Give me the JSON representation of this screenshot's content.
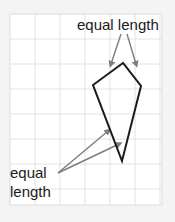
{
  "figure": {
    "type": "geometry-diagram",
    "shape_name": "kite",
    "background_color": "#f4f4f4",
    "canvas_color": "#ffffff",
    "grid": {
      "color": "#e2e2e4",
      "x": 10,
      "y": 14,
      "width": 152,
      "height": 191,
      "cell_size": 25,
      "columns": 6,
      "rows": 7,
      "visible": true
    },
    "shape": {
      "stroke_color": "#1a1a1a",
      "stroke_width": 2,
      "fill": "none",
      "vertices": [
        {
          "name": "apex-top",
          "x": 123,
          "y": 63
        },
        {
          "name": "left",
          "x": 93,
          "y": 85
        },
        {
          "name": "bottom",
          "x": 122,
          "y": 161
        },
        {
          "name": "right",
          "x": 141,
          "y": 86
        }
      ],
      "points_attr": "123,63 93,85 122,161 141,86"
    },
    "annotations": {
      "color": "#7d7d7d",
      "top": {
        "label": "equal length",
        "text_x": 77,
        "text_y": 30,
        "arrows": [
          {
            "name": "top-left-arrow",
            "x1": 121,
            "y1": 34,
            "x2": 111,
            "y2": 64
          },
          {
            "name": "top-right-arrow",
            "x1": 127,
            "y1": 34,
            "x2": 136,
            "y2": 64
          }
        ]
      },
      "bottom": {
        "label_line1": "equal",
        "label_line2": "length",
        "text_x": 10,
        "text_y1": 178,
        "text_y2": 197,
        "arrows": [
          {
            "name": "bottom-upper-arrow",
            "x1": 58,
            "y1": 173,
            "x2": 108,
            "y2": 131
          },
          {
            "name": "bottom-lower-arrow",
            "x1": 58,
            "y1": 173,
            "x2": 119,
            "y2": 144
          }
        ]
      }
    }
  }
}
